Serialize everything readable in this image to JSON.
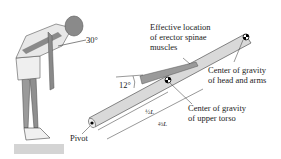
{
  "figure": {
    "labels": {
      "angle_back": "30°",
      "angle_muscle": "12°",
      "pivot": "Pivot",
      "muscle_line1": "Effective location",
      "muscle_line2": "of erector spinae",
      "muscle_line3": "muscles",
      "cog_head_line1": "Center of gravity",
      "cog_head_line2": "of head and arms",
      "cog_torso_line1": "Center of gravity",
      "cog_torso_line2": "of upper torso",
      "half_L": "½L",
      "two_thirds_L": "⅔L"
    },
    "colors": {
      "beam_fill": "#d9d9d9",
      "beam_stroke": "#555555",
      "muscle_fill": "#9a9a9a",
      "figure_skin": "#8a8a8a",
      "shirt": "#e6e6e6",
      "ground": "#cfcfcf"
    }
  }
}
